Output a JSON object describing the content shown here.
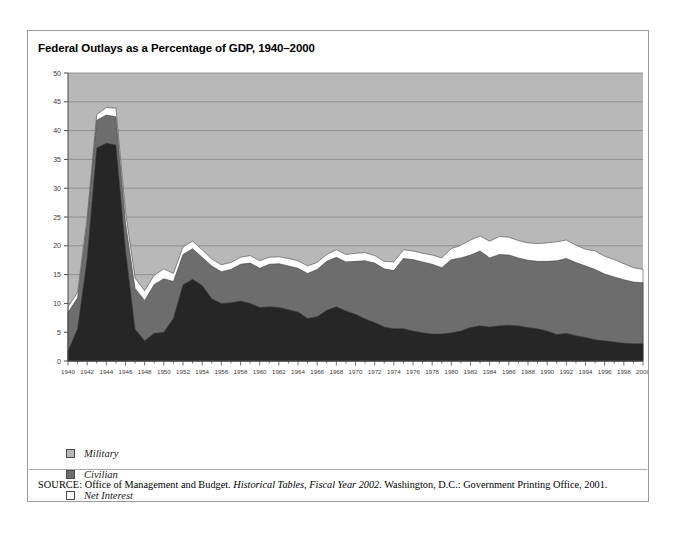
{
  "figure": {
    "title": "Federal Outlays as a Percentage of GDP, 1940–2000",
    "source_kicker": "SOURCE:",
    "source_part1": " Office of Management and Budget. ",
    "source_italic": "Historical Tables, Fiscal Year 2002.",
    "source_part2": " Washington, D.C.: Government Printing Office, 2001."
  },
  "legend": {
    "position": "below-plot",
    "items": [
      {
        "label": "Military",
        "color": "#b8b8b8"
      },
      {
        "label": "Civilian",
        "color": "#6d6d6d"
      },
      {
        "label": "Net Interest",
        "color": "#ffffff"
      }
    ]
  },
  "colors": {
    "plot_background": "#b8b8b8",
    "gridline": "#8c8c8c",
    "military": "#262626",
    "civilian": "#6d6d6d",
    "net_interest": "#ffffff",
    "frame": "#9a9a9a",
    "axis": "#4a4a4a"
  },
  "chart_data": {
    "type": "area",
    "stacked": true,
    "title": "Federal Outlays as a Percentage of GDP, 1940–2000",
    "xlabel": "",
    "ylabel": "",
    "xlim": [
      1940,
      2000
    ],
    "ylim": [
      0,
      50
    ],
    "ytick_step": 5,
    "xtick_step": 2,
    "grid": true,
    "legend_entries": [
      "Military",
      "Civilian",
      "Net Interest"
    ],
    "ytick_labels": [
      "0",
      "5",
      "10",
      "15",
      "20",
      "25",
      "30",
      "35",
      "40",
      "45",
      "50"
    ],
    "xtick_labels": [
      "1940",
      "1942",
      "1944",
      "1946",
      "1948",
      "1950",
      "1952",
      "1954",
      "1956",
      "1958",
      "1960",
      "1962",
      "1964",
      "1966",
      "1968",
      "1970",
      "1972",
      "1974",
      "1976",
      "1978",
      "1980",
      "1982",
      "1984",
      "1986",
      "1988",
      "1990",
      "1992",
      "1994",
      "1996",
      "1998",
      "2000"
    ],
    "x": [
      1940,
      1941,
      1942,
      1943,
      1944,
      1945,
      1946,
      1947,
      1948,
      1949,
      1950,
      1951,
      1952,
      1953,
      1954,
      1955,
      1956,
      1957,
      1958,
      1959,
      1960,
      1961,
      1962,
      1963,
      1964,
      1965,
      1966,
      1967,
      1968,
      1969,
      1970,
      1971,
      1972,
      1973,
      1974,
      1975,
      1976,
      1977,
      1978,
      1979,
      1980,
      1981,
      1982,
      1983,
      1984,
      1985,
      1986,
      1987,
      1988,
      1989,
      1990,
      1991,
      1992,
      1993,
      1994,
      1995,
      1996,
      1997,
      1998,
      1999,
      2000
    ],
    "series": [
      {
        "name": "Military",
        "color": "#262626",
        "values": [
          1.7,
          5.6,
          17.8,
          37.0,
          37.8,
          37.5,
          19.2,
          5.5,
          3.5,
          4.8,
          5.0,
          7.4,
          13.2,
          14.2,
          13.1,
          10.8,
          10.0,
          10.1,
          10.4,
          10.0,
          9.3,
          9.4,
          9.3,
          8.9,
          8.5,
          7.4,
          7.7,
          8.8,
          9.4,
          8.7,
          8.1,
          7.3,
          6.7,
          5.9,
          5.6,
          5.6,
          5.2,
          4.9,
          4.7,
          4.7,
          4.9,
          5.2,
          5.8,
          6.1,
          5.9,
          6.1,
          6.2,
          6.1,
          5.8,
          5.6,
          5.2,
          4.6,
          4.8,
          4.4,
          4.1,
          3.7,
          3.5,
          3.3,
          3.1,
          3.0,
          3.0
        ]
      },
      {
        "name": "Civilian",
        "color": "#6d6d6d",
        "values": [
          6.7,
          5.4,
          6.2,
          4.8,
          4.9,
          4.9,
          4.8,
          7.1,
          7.0,
          8.5,
          9.3,
          6.4,
          5.3,
          5.3,
          4.9,
          5.7,
          5.5,
          5.8,
          6.4,
          7.0,
          6.8,
          7.4,
          7.6,
          7.6,
          7.6,
          7.8,
          8.2,
          8.5,
          8.6,
          8.5,
          9.2,
          10.1,
          10.3,
          10.1,
          10.1,
          12.2,
          12.4,
          12.3,
          12.1,
          11.5,
          12.7,
          12.7,
          12.6,
          13.0,
          12.0,
          12.4,
          12.2,
          11.8,
          11.7,
          11.7,
          12.1,
          12.8,
          13.0,
          12.7,
          12.4,
          12.2,
          11.6,
          11.3,
          11.0,
          10.7,
          10.6
        ]
      },
      {
        "name": "Net Interest",
        "color": "#ffffff",
        "values": [
          1.0,
          0.9,
          0.9,
          1.0,
          1.3,
          1.5,
          1.8,
          1.8,
          1.7,
          1.6,
          1.7,
          1.4,
          1.3,
          1.3,
          1.3,
          1.2,
          1.2,
          1.2,
          1.2,
          1.3,
          1.3,
          1.2,
          1.2,
          1.3,
          1.3,
          1.3,
          1.2,
          1.2,
          1.3,
          1.3,
          1.4,
          1.4,
          1.3,
          1.3,
          1.5,
          1.5,
          1.5,
          1.5,
          1.6,
          1.7,
          1.9,
          2.2,
          2.6,
          2.6,
          2.9,
          3.1,
          3.1,
          3.0,
          3.0,
          3.1,
          3.2,
          3.3,
          3.2,
          3.0,
          2.9,
          3.2,
          3.1,
          3.0,
          2.8,
          2.5,
          2.3
        ]
      }
    ]
  }
}
